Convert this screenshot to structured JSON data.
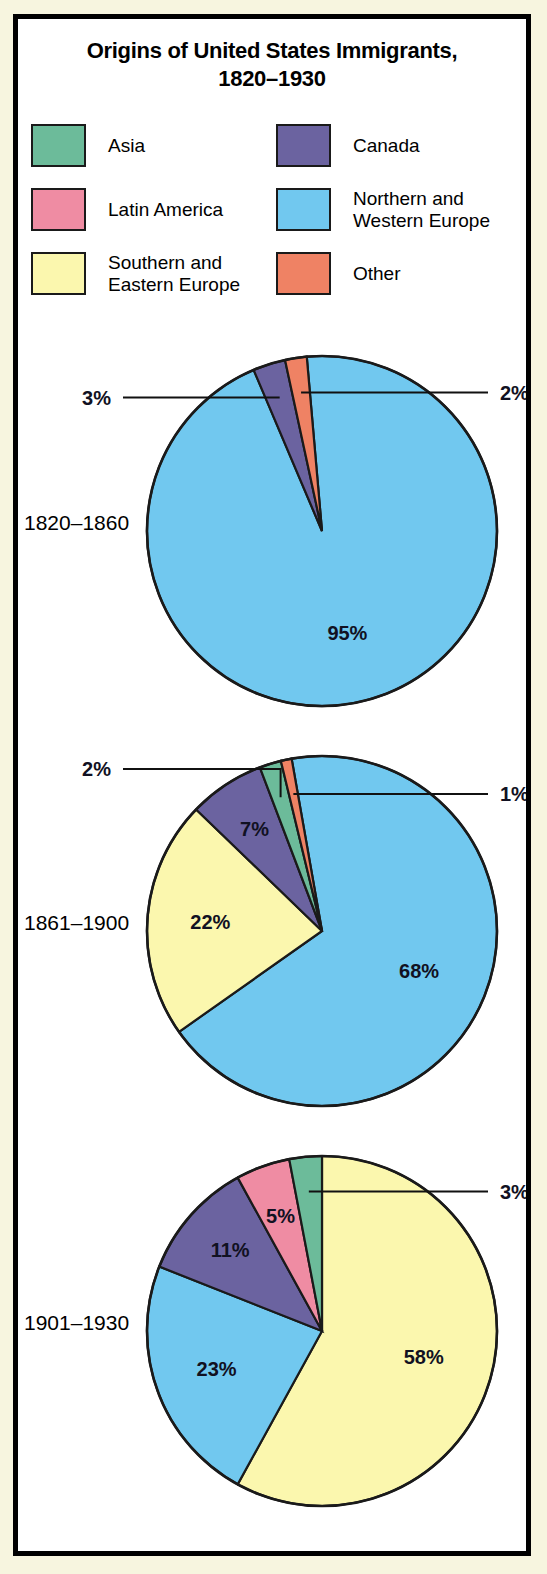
{
  "title": {
    "line1": "Origins of United States Immigrants,",
    "line2": "1820–1930"
  },
  "legend": {
    "items": [
      {
        "label": "Asia",
        "color": "#6cbb9a"
      },
      {
        "label": "Latin America",
        "color": "#ef8ca3"
      },
      {
        "label": "Southern and\nEastern Europe",
        "color": "#fbf7ae"
      },
      {
        "label": "Canada",
        "color": "#6b63a0"
      },
      {
        "label": "Northern and\nWestern Europe",
        "color": "#71c8ef"
      },
      {
        "label": "Other",
        "color": "#ef8264"
      }
    ]
  },
  "chart_data": {
    "type": "pie",
    "title": "Origins of United States Immigrants, 1820–1930",
    "units": "percent",
    "legend_position": "top",
    "category_colors": {
      "Asia": "#6cbb9a",
      "Latin America": "#ef8ca3",
      "Southern and Eastern Europe": "#fbf7ae",
      "Canada": "#6b63a0",
      "Northern and Western Europe": "#71c8ef",
      "Other": "#ef8264"
    },
    "charts": [
      {
        "period": "1820–1860",
        "slices": [
          {
            "category": "Northern and Western Europe",
            "value": 95,
            "label": "95%",
            "label_placement": "inside"
          },
          {
            "category": "Canada",
            "value": 3,
            "label": "3%",
            "label_placement": "callout-left"
          },
          {
            "category": "Other",
            "value": 2,
            "label": "2%",
            "label_placement": "callout-right"
          }
        ]
      },
      {
        "period": "1861–1900",
        "slices": [
          {
            "category": "Northern and Western Europe",
            "value": 68,
            "label": "68%",
            "label_placement": "inside"
          },
          {
            "category": "Southern and Eastern Europe",
            "value": 22,
            "label": "22%",
            "label_placement": "inside"
          },
          {
            "category": "Canada",
            "value": 7,
            "label": "7%",
            "label_placement": "inside"
          },
          {
            "category": "Asia",
            "value": 2,
            "label": "2%",
            "label_placement": "callout-left"
          },
          {
            "category": "Other",
            "value": 1,
            "label": "1%",
            "label_placement": "callout-right"
          }
        ]
      },
      {
        "period": "1901–1930",
        "slices": [
          {
            "category": "Southern and Eastern Europe",
            "value": 58,
            "label": "58%",
            "label_placement": "inside"
          },
          {
            "category": "Northern and Western Europe",
            "value": 23,
            "label": "23%",
            "label_placement": "inside"
          },
          {
            "category": "Canada",
            "value": 11,
            "label": "11%",
            "label_placement": "inside"
          },
          {
            "category": "Latin America",
            "value": 5,
            "label": "5%",
            "label_placement": "inside"
          },
          {
            "category": "Asia",
            "value": 3,
            "label": "3%",
            "label_placement": "callout-right"
          }
        ]
      }
    ]
  },
  "pies": [
    {
      "period": "1820–1860"
    },
    {
      "period": "1861–1900"
    },
    {
      "period": "1901–1930"
    }
  ]
}
